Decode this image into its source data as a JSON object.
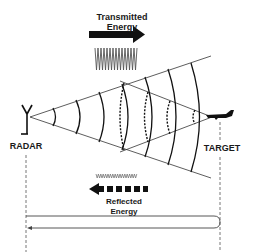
{
  "diagram": {
    "labels": {
      "transmitted": "Transmitted\nEnergy",
      "transmitted_line1": "Transmitted",
      "transmitted_line2": "Energy",
      "reflected_line1": "Reflected",
      "reflected_line2": "Energy",
      "radar": "RADAR",
      "target": "TARGET"
    },
    "icons": {
      "radar": "antenna-icon",
      "target": "aircraft-icon",
      "transmitted_arrow": "arrow-right-solid-icon",
      "reflected_arrow": "arrow-left-dashed-icon",
      "transmitted_wave": "high-amplitude-waveform",
      "reflected_wave": "low-amplitude-waveform"
    },
    "colors": {
      "line": "#222222",
      "thin_line": "#555555",
      "dashed_guide": "#777777",
      "background": "#ffffff"
    },
    "nodes": [
      {
        "id": "radar",
        "label": "RADAR",
        "x": 26
      },
      {
        "id": "target",
        "label": "TARGET",
        "x": 220
      }
    ],
    "edges": [
      {
        "from": "radar",
        "to": "target",
        "label": "Transmitted Energy",
        "style": "solid-thick"
      },
      {
        "from": "target",
        "to": "radar",
        "label": "Reflected Energy",
        "style": "dashed-thick"
      },
      {
        "from": "radar",
        "to": "target",
        "label": "round-trip path",
        "style": "thin-loop"
      }
    ]
  }
}
